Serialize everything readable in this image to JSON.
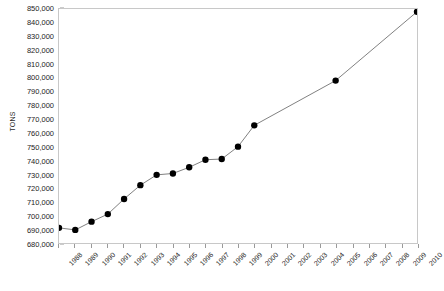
{
  "chart_data": {
    "type": "line",
    "title": "",
    "xlabel": "",
    "ylabel": "TONS",
    "ylim": [
      680000,
      850000
    ],
    "ytick_step": 10000,
    "grid": false,
    "legend": "none",
    "marker": "filled-circle",
    "line_color": "#808080",
    "marker_color": "#000000",
    "ytick_labels": [
      "850,000",
      "840,000",
      "830,000",
      "820,000",
      "810,000",
      "800,000",
      "790,000",
      "780,000",
      "770,000",
      "760,000",
      "750,000",
      "740,000",
      "730,000",
      "720,000",
      "710,000",
      "700,000",
      "690,000",
      "680,000"
    ],
    "ytick_values": [
      850000,
      840000,
      830000,
      820000,
      810000,
      800000,
      790000,
      780000,
      770000,
      760000,
      750000,
      740000,
      730000,
      720000,
      710000,
      700000,
      690000,
      680000
    ],
    "xtick_labels": [
      "1988",
      "1989",
      "1990",
      "1991",
      "1992",
      "1993",
      "1994",
      "1995",
      "1996",
      "1997",
      "1998",
      "1999",
      "2000",
      "2001",
      "2002",
      "2003",
      "2004",
      "2005",
      "2006",
      "2007",
      "2008",
      "2009",
      "2010"
    ],
    "xtick_values": [
      1988,
      1989,
      1990,
      1991,
      1992,
      1993,
      1994,
      1995,
      1996,
      1997,
      1998,
      1999,
      2000,
      2001,
      2002,
      2003,
      2004,
      2005,
      2006,
      2007,
      2008,
      2009,
      2010
    ],
    "x": [
      1988,
      1989,
      1990,
      1991,
      1992,
      1993,
      1994,
      1995,
      1996,
      1997,
      1998,
      1999,
      2000,
      2005,
      2010
    ],
    "values": [
      691000,
      689500,
      695500,
      701000,
      712000,
      722000,
      729500,
      730500,
      735000,
      740500,
      741000,
      750000,
      765500,
      798000,
      848000
    ]
  }
}
